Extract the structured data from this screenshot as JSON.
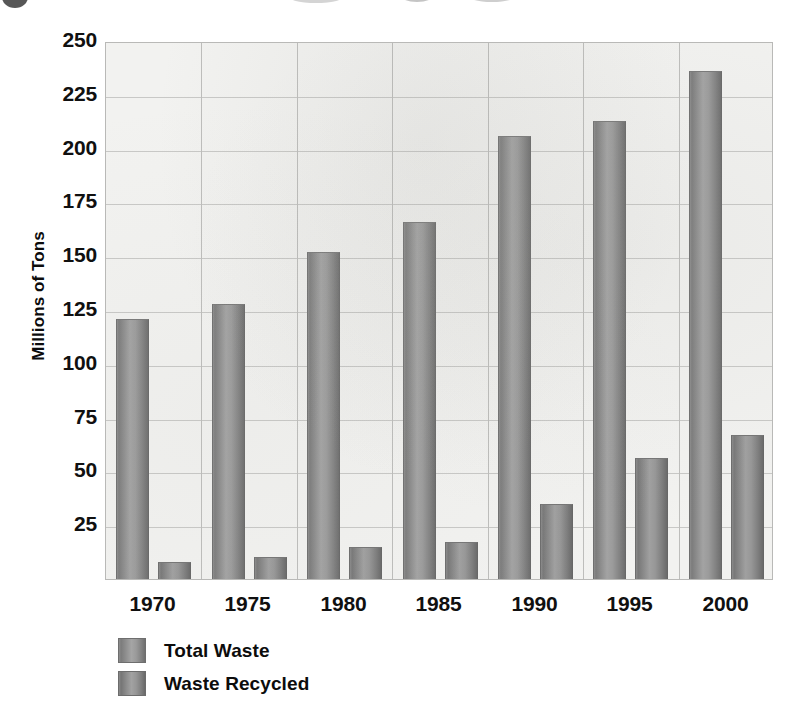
{
  "chart_data": {
    "type": "bar",
    "title": "",
    "xlabel": "",
    "ylabel": "Millions of Tons",
    "categories": [
      "1970",
      "1975",
      "1980",
      "1985",
      "1990",
      "1995",
      "2000"
    ],
    "series": [
      {
        "name": "Total Waste",
        "values": [
          121,
          128,
          152,
          166,
          206,
          213,
          236
        ]
      },
      {
        "name": "Waste Recycled",
        "values": [
          8,
          10,
          15,
          17,
          35,
          56,
          67
        ]
      }
    ],
    "ylim": [
      0,
      250
    ],
    "yticks": [
      250,
      225,
      200,
      175,
      150,
      125,
      100,
      75,
      50,
      25
    ],
    "ytick_labels": [
      "250",
      "225",
      "200",
      "175",
      "150",
      "125",
      "100",
      "75",
      "50",
      "25"
    ],
    "grid": "horizontal-and-vertical",
    "legend_position": "bottom-left",
    "legend": [
      "Total Waste",
      "Waste Recycled"
    ],
    "colors": {
      "total_waste": "#8e8e8e",
      "waste_recycled": "#8b8b8b",
      "plot_background": "#f2f2f0",
      "gridline": "#c8c8c6",
      "axis_border": "#b9b9b7",
      "text": "#101010"
    }
  }
}
